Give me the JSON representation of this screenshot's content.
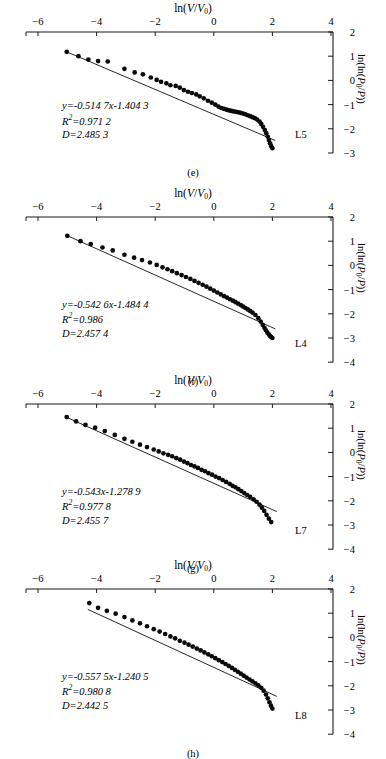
{
  "figure": {
    "axis_labels": {
      "x": "ln(V/V0)",
      "y": "ln(ln(P0/P))"
    },
    "x_ticks": [
      "-6",
      "-4",
      "-2",
      "0",
      "2",
      "4"
    ],
    "panels": [
      {
        "caption": "(e)",
        "sample": "L5",
        "equation": "y=-0.514 7x-1.404 3",
        "r2": "R2=0.971 2",
        "d": "D=2.485 3",
        "y_ticks": [
          "2",
          "1",
          "0",
          "-1",
          "-2",
          "-3"
        ]
      },
      {
        "caption": "(f)",
        "sample": "L4",
        "equation": "y=-0.542 6x-1.484 4",
        "r2": "R2=0.986",
        "d": "D=2.457 4",
        "y_ticks": [
          "2",
          "1",
          "0",
          "-1",
          "-2",
          "-3",
          "-4"
        ]
      },
      {
        "caption": "(g)",
        "sample": "L7",
        "equation": "y=-0.543x-1.278 9",
        "r2": "R2=0.977 8",
        "d": "D=2.455 7",
        "y_ticks": [
          "2",
          "1",
          "0",
          "-1",
          "-2",
          "-3",
          "-4"
        ]
      },
      {
        "caption": "(h)",
        "sample": "L8",
        "equation": "y=-0.557 5x-1.240 5",
        "r2": "R2=0.980 8",
        "d": "D=2.442 5",
        "y_ticks": [
          "2",
          "1",
          "0",
          "-1",
          "-2",
          "-3",
          "-4"
        ]
      }
    ]
  },
  "chart_data": [
    {
      "type": "scatter",
      "panel": "(e)",
      "sample": "L5",
      "title": "",
      "xlabel": "ln(V/V0)",
      "ylabel": "ln(ln(P0/P))",
      "xlim": [
        -6,
        4
      ],
      "ylim": [
        -3,
        2
      ],
      "xticks": [
        -6,
        -4,
        -2,
        0,
        2,
        4
      ],
      "yticks": [
        2,
        1,
        0,
        -1,
        -2,
        -3
      ],
      "grid": false,
      "legend": false,
      "fit_line": {
        "slope": -0.5147,
        "intercept": -1.4043,
        "r2": 0.9712,
        "fractal_dimension": 2.4853,
        "x_start": -5.05,
        "x_end": 2.1
      },
      "annotations": [
        "y=-0.514 7x-1.404 3",
        "R2=0.971 2",
        "D=2.485 3",
        "L5"
      ],
      "points": [
        [
          -5.02,
          1.18
        ],
        [
          -4.62,
          1.0
        ],
        [
          -4.28,
          0.86
        ],
        [
          -3.95,
          0.8
        ],
        [
          -3.62,
          0.78
        ],
        [
          -3.05,
          0.48
        ],
        [
          -2.7,
          0.33
        ],
        [
          -2.42,
          0.25
        ],
        [
          -2.15,
          0.12
        ],
        [
          -1.95,
          0.02
        ],
        [
          -1.8,
          -0.06
        ],
        [
          -1.62,
          -0.12
        ],
        [
          -1.48,
          -0.2
        ],
        [
          -1.3,
          -0.23
        ],
        [
          -1.16,
          -0.3
        ],
        [
          -1.02,
          -0.4
        ],
        [
          -0.88,
          -0.47
        ],
        [
          -0.75,
          -0.52
        ],
        [
          -0.6,
          -0.58
        ],
        [
          -0.48,
          -0.66
        ],
        [
          -0.34,
          -0.74
        ],
        [
          -0.2,
          -0.84
        ],
        [
          -0.07,
          -0.92
        ],
        [
          0.05,
          -1.0
        ],
        [
          0.16,
          -1.08
        ],
        [
          0.26,
          -1.14
        ],
        [
          0.35,
          -1.18
        ],
        [
          0.44,
          -1.21
        ],
        [
          0.52,
          -1.24
        ],
        [
          0.6,
          -1.26
        ],
        [
          0.68,
          -1.28
        ],
        [
          0.76,
          -1.3
        ],
        [
          0.84,
          -1.32
        ],
        [
          0.92,
          -1.34
        ],
        [
          1.0,
          -1.37
        ],
        [
          1.08,
          -1.4
        ],
        [
          1.16,
          -1.44
        ],
        [
          1.24,
          -1.48
        ],
        [
          1.32,
          -1.52
        ],
        [
          1.4,
          -1.56
        ],
        [
          1.48,
          -1.62
        ],
        [
          1.56,
          -1.7
        ],
        [
          1.62,
          -1.8
        ],
        [
          1.68,
          -1.92
        ],
        [
          1.74,
          -2.05
        ],
        [
          1.79,
          -2.18
        ],
        [
          1.84,
          -2.32
        ],
        [
          1.88,
          -2.46
        ],
        [
          1.92,
          -2.6
        ],
        [
          1.96,
          -2.72
        ],
        [
          2.0,
          -2.8
        ]
      ]
    },
    {
      "type": "scatter",
      "panel": "(f)",
      "sample": "L4",
      "title": "",
      "xlabel": "ln(V/V0)",
      "ylabel": "ln(ln(P0/P))",
      "xlim": [
        -6,
        4
      ],
      "ylim": [
        -4,
        2
      ],
      "xticks": [
        -6,
        -4,
        -2,
        0,
        2,
        4
      ],
      "yticks": [
        2,
        1,
        0,
        -1,
        -2,
        -3,
        -4
      ],
      "grid": false,
      "legend": false,
      "fit_line": {
        "slope": -0.5426,
        "intercept": -1.4844,
        "r2": 0.986,
        "fractal_dimension": 2.4574,
        "x_start": -5.05,
        "x_end": 2.1
      },
      "annotations": [
        "y=-0.542 6x-1.484 4",
        "R2=0.986",
        "D=2.457 4",
        "L4"
      ],
      "points": [
        [
          -5.0,
          1.22
        ],
        [
          -4.55,
          1.0
        ],
        [
          -4.2,
          0.88
        ],
        [
          -3.8,
          0.74
        ],
        [
          -3.45,
          0.62
        ],
        [
          -3.05,
          0.44
        ],
        [
          -2.72,
          0.32
        ],
        [
          -2.45,
          0.22
        ],
        [
          -2.18,
          0.12
        ],
        [
          -1.95,
          0.02
        ],
        [
          -1.75,
          -0.08
        ],
        [
          -1.58,
          -0.16
        ],
        [
          -1.42,
          -0.24
        ],
        [
          -1.26,
          -0.32
        ],
        [
          -1.1,
          -0.4
        ],
        [
          -0.95,
          -0.48
        ],
        [
          -0.8,
          -0.56
        ],
        [
          -0.66,
          -0.64
        ],
        [
          -0.52,
          -0.72
        ],
        [
          -0.38,
          -0.8
        ],
        [
          -0.25,
          -0.88
        ],
        [
          -0.12,
          -0.96
        ],
        [
          0.0,
          -1.04
        ],
        [
          0.12,
          -1.12
        ],
        [
          0.24,
          -1.2
        ],
        [
          0.35,
          -1.27
        ],
        [
          0.45,
          -1.33
        ],
        [
          0.55,
          -1.4
        ],
        [
          0.65,
          -1.46
        ],
        [
          0.74,
          -1.52
        ],
        [
          0.83,
          -1.58
        ],
        [
          0.92,
          -1.64
        ],
        [
          1.0,
          -1.7
        ],
        [
          1.08,
          -1.76
        ],
        [
          1.16,
          -1.82
        ],
        [
          1.24,
          -1.88
        ],
        [
          1.32,
          -1.95
        ],
        [
          1.42,
          -2.05
        ],
        [
          1.52,
          -2.18
        ],
        [
          1.6,
          -2.32
        ],
        [
          1.67,
          -2.46
        ],
        [
          1.73,
          -2.58
        ],
        [
          1.78,
          -2.68
        ],
        [
          1.83,
          -2.78
        ],
        [
          1.88,
          -2.86
        ],
        [
          1.92,
          -2.92
        ],
        [
          1.96,
          -2.96
        ],
        [
          2.0,
          -3.0
        ]
      ]
    },
    {
      "type": "scatter",
      "panel": "(g)",
      "sample": "L7",
      "title": "",
      "xlabel": "ln(V/V0)",
      "ylabel": "ln(ln(P0/P))",
      "xlim": [
        -6,
        4
      ],
      "ylim": [
        -4,
        2
      ],
      "xticks": [
        -6,
        -4,
        -2,
        0,
        2,
        4
      ],
      "yticks": [
        2,
        1,
        0,
        -1,
        -2,
        -3,
        -4
      ],
      "grid": false,
      "legend": false,
      "fit_line": {
        "slope": -0.543,
        "intercept": -1.2789,
        "r2": 0.9778,
        "fractal_dimension": 2.4557,
        "x_start": -5.05,
        "x_end": 2.15
      },
      "annotations": [
        "y=-0.543x-1.278 9",
        "R2=0.977 8",
        "D=2.455 7",
        "L7"
      ],
      "points": [
        [
          -5.02,
          1.46
        ],
        [
          -4.7,
          1.28
        ],
        [
          -4.38,
          1.14
        ],
        [
          -4.05,
          1.02
        ],
        [
          -3.72,
          0.88
        ],
        [
          -3.38,
          0.72
        ],
        [
          -3.05,
          0.56
        ],
        [
          -2.78,
          0.44
        ],
        [
          -2.52,
          0.32
        ],
        [
          -2.28,
          0.22
        ],
        [
          -2.05,
          0.12
        ],
        [
          -1.88,
          0.04
        ],
        [
          -1.72,
          -0.04
        ],
        [
          -1.56,
          -0.1
        ],
        [
          -1.42,
          -0.16
        ],
        [
          -1.28,
          -0.24
        ],
        [
          -1.15,
          -0.3
        ],
        [
          -1.02,
          -0.38
        ],
        [
          -0.9,
          -0.44
        ],
        [
          -0.78,
          -0.52
        ],
        [
          -0.66,
          -0.58
        ],
        [
          -0.54,
          -0.64
        ],
        [
          -0.42,
          -0.72
        ],
        [
          -0.3,
          -0.78
        ],
        [
          -0.18,
          -0.86
        ],
        [
          -0.06,
          -0.92
        ],
        [
          0.06,
          -1.0
        ],
        [
          0.18,
          -1.06
        ],
        [
          0.3,
          -1.14
        ],
        [
          0.42,
          -1.22
        ],
        [
          0.54,
          -1.3
        ],
        [
          0.64,
          -1.38
        ],
        [
          0.74,
          -1.44
        ],
        [
          0.84,
          -1.52
        ],
        [
          0.94,
          -1.6
        ],
        [
          1.04,
          -1.68
        ],
        [
          1.14,
          -1.76
        ],
        [
          1.24,
          -1.84
        ],
        [
          1.36,
          -1.94
        ],
        [
          1.46,
          -2.04
        ],
        [
          1.56,
          -2.16
        ],
        [
          1.64,
          -2.28
        ],
        [
          1.72,
          -2.42
        ],
        [
          1.8,
          -2.58
        ],
        [
          1.88,
          -2.74
        ],
        [
          1.96,
          -2.88
        ]
      ]
    },
    {
      "type": "scatter",
      "panel": "(h)",
      "sample": "L8",
      "title": "",
      "xlabel": "ln(V/V0)",
      "ylabel": "ln(ln(P0/P))",
      "xlim": [
        -6,
        4
      ],
      "ylim": [
        -4,
        2
      ],
      "xticks": [
        -6,
        -4,
        -2,
        0,
        2,
        4
      ],
      "yticks": [
        2,
        1,
        0,
        -1,
        -2,
        -3,
        -4
      ],
      "grid": false,
      "legend": false,
      "fit_line": {
        "slope": -0.5575,
        "intercept": -1.2405,
        "r2": 0.9808,
        "fractal_dimension": 2.4425,
        "x_start": -4.3,
        "x_end": 2.15
      },
      "annotations": [
        "y=-0.557 5x-1.240 5",
        "R2=0.980 8",
        "D=2.442 5",
        "L8"
      ],
      "points": [
        [
          -4.25,
          1.42
        ],
        [
          -3.95,
          1.22
        ],
        [
          -3.65,
          1.1
        ],
        [
          -3.35,
          0.98
        ],
        [
          -3.05,
          0.84
        ],
        [
          -2.78,
          0.7
        ],
        [
          -2.52,
          0.58
        ],
        [
          -2.28,
          0.46
        ],
        [
          -2.05,
          0.34
        ],
        [
          -1.85,
          0.24
        ],
        [
          -1.66,
          0.14
        ],
        [
          -1.48,
          0.04
        ],
        [
          -1.32,
          -0.04
        ],
        [
          -1.16,
          -0.14
        ],
        [
          -1.0,
          -0.22
        ],
        [
          -0.86,
          -0.3
        ],
        [
          -0.72,
          -0.38
        ],
        [
          -0.58,
          -0.46
        ],
        [
          -0.45,
          -0.54
        ],
        [
          -0.32,
          -0.62
        ],
        [
          -0.19,
          -0.7
        ],
        [
          -0.07,
          -0.78
        ],
        [
          0.05,
          -0.86
        ],
        [
          0.17,
          -0.94
        ],
        [
          0.29,
          -1.02
        ],
        [
          0.4,
          -1.1
        ],
        [
          0.51,
          -1.18
        ],
        [
          0.62,
          -1.26
        ],
        [
          0.72,
          -1.34
        ],
        [
          0.82,
          -1.42
        ],
        [
          0.92,
          -1.5
        ],
        [
          1.02,
          -1.58
        ],
        [
          1.12,
          -1.66
        ],
        [
          1.22,
          -1.74
        ],
        [
          1.32,
          -1.82
        ],
        [
          1.42,
          -1.9
        ],
        [
          1.52,
          -1.98
        ],
        [
          1.62,
          -2.08
        ],
        [
          1.7,
          -2.2
        ],
        [
          1.78,
          -2.36
        ],
        [
          1.84,
          -2.52
        ],
        [
          1.9,
          -2.68
        ],
        [
          1.95,
          -2.82
        ],
        [
          2.0,
          -2.94
        ]
      ]
    }
  ]
}
